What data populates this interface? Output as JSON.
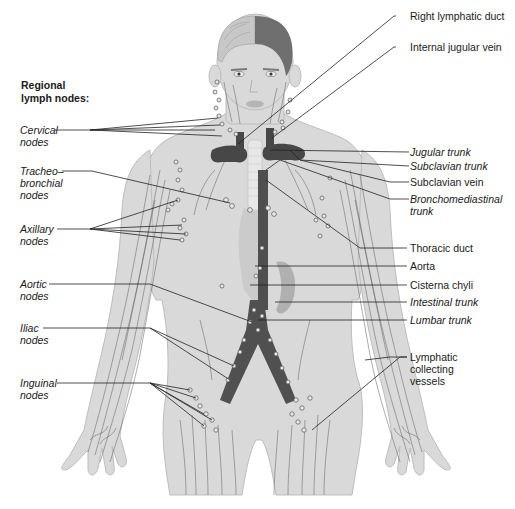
{
  "heading": {
    "line1": "Regional",
    "line2": "lymph nodes:"
  },
  "left_labels": {
    "cervical": {
      "line1": "Cervical",
      "line2": "nodes"
    },
    "tracheobronchial": {
      "line1": "Tracheo–",
      "line2": "bronchial",
      "line3": "nodes"
    },
    "axillary": {
      "line1": "Axillary",
      "line2": "nodes"
    },
    "aortic": {
      "line1": "Aortic",
      "line2": "nodes"
    },
    "iliac": {
      "line1": "Iliac",
      "line2": "nodes"
    },
    "inguinal": {
      "line1": "Inguinal",
      "line2": "nodes"
    }
  },
  "right_labels": {
    "right_lymphatic_duct": "Right lymphatic duct",
    "internal_jugular_vein": "Internal jugular vein",
    "jugular_trunk": "Jugular trunk",
    "subclavian_trunk": "Subclavian trunk",
    "subclavian_vein": "Subclavian vein",
    "bronchomediastinal": {
      "line1": "Bronchomediastinal",
      "line2": "trunk"
    },
    "thoracic_duct": "Thoracic duct",
    "aorta": "Aorta",
    "cisterna_chyli": "Cisterna chyli",
    "intestinal_trunk": "Intestinal trunk",
    "lumbar_trunk": "Lumbar trunk",
    "lymphatic_vessels": {
      "line1": "Lymphatic",
      "line2": "collecting",
      "line3": "vessels"
    }
  },
  "colors": {
    "background": "#ffffff",
    "body_fill": "#d9d9d9",
    "body_stroke": "#b8b8b8",
    "vessel_dark": "#4a4a4a",
    "vein_dark": "#3c3c3c",
    "leader_line": "#222222",
    "text": "#1a1a1a"
  }
}
